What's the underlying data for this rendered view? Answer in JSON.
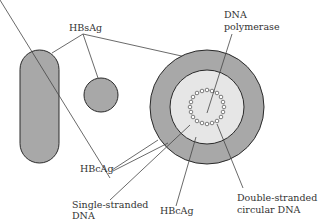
{
  "figure": {
    "colors": {
      "particle_fill": "#a8a8a8",
      "core_fill": "#e6e6e6",
      "outline": "#2a2a2a",
      "leader_line": "#444444",
      "text": "#333333"
    },
    "labels": {
      "hbsag": "HBsAg",
      "dna_polymerase_line1": "DNA",
      "dna_polymerase_line2": "polymerase",
      "hbcag_left": "HBcAg",
      "single_stranded_line1": "Single-stranded",
      "single_stranded_line2": "DNA",
      "double_stranded_line1": "Double-stranded",
      "double_stranded_line2": "circular DNA",
      "hbcag_bottom": "HBcAg"
    },
    "particles": [
      {
        "name": "filamentous-particle",
        "shape": "rounded-rod"
      },
      {
        "name": "spherical-particle",
        "shape": "small-circle"
      },
      {
        "name": "dane-particle",
        "shape": "concentric-circles"
      }
    ]
  }
}
